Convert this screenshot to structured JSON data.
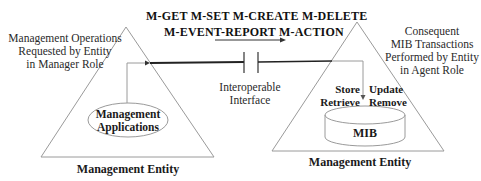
{
  "operations": {
    "line1": "M-GET  M-SET  M-CREATE  M-DELETE",
    "line2": "M-EVENT-REPORT  M-ACTION"
  },
  "left_entity": {
    "caption_lines": [
      "Management Operations",
      "Requested by Entity",
      "in Manager Role"
    ],
    "inner_component_lines": [
      "Management",
      "Applications"
    ],
    "label": "Management Entity"
  },
  "interface": {
    "label_lines": [
      "Interoperable",
      "Interface"
    ]
  },
  "right_entity": {
    "caption_lines": [
      "Consequent",
      "MIB Transactions",
      "Performed by Entity",
      "in Agent Role"
    ],
    "left_actions": [
      "Store",
      "Retrieve"
    ],
    "right_actions": [
      "Update",
      "Remove"
    ],
    "database_label": "MIB",
    "label": "Management Entity"
  },
  "colors": {
    "line": "#8a8a8a",
    "connector": "#222222",
    "text": "#222222"
  }
}
